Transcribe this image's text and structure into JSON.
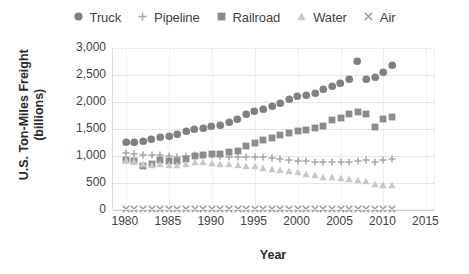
{
  "chart_data": {
    "type": "scatter",
    "title": "",
    "xlabel": "Year",
    "ylabel": "U.S. Ton-Miles Freight (billions)",
    "xlim": [
      1978.5,
      2016
    ],
    "ylim": [
      0,
      3000
    ],
    "grid": true,
    "legend_position": "top-center",
    "xticks": [
      "1980",
      "1985",
      "1990",
      "1995",
      "2000",
      "2005",
      "2010",
      "2015"
    ],
    "xtick_values": [
      1980,
      1985,
      1990,
      1995,
      2000,
      2005,
      2010,
      2015
    ],
    "yticks": [
      "0",
      "500",
      "1,000",
      "1,500",
      "2,000",
      "2,500",
      "3,000"
    ],
    "ytick_values": [
      0,
      500,
      1000,
      1500,
      2000,
      2500,
      3000
    ],
    "x": [
      1980,
      1981,
      1982,
      1983,
      1984,
      1985,
      1986,
      1987,
      1988,
      1989,
      1990,
      1991,
      1992,
      1993,
      1994,
      1995,
      1996,
      1997,
      1998,
      1999,
      2000,
      2001,
      2002,
      2003,
      2004,
      2005,
      2006,
      2007,
      2008,
      2009,
      2010,
      2011
    ],
    "series": [
      {
        "name": "Truck",
        "marker": "circle",
        "color": "#808080",
        "values": [
          1250,
          1260,
          1280,
          1310,
          1340,
          1370,
          1400,
          1450,
          1490,
          1520,
          1560,
          1570,
          1620,
          1680,
          1770,
          1820,
          1870,
          1920,
          1970,
          2050,
          2100,
          2120,
          2170,
          2230,
          2300,
          2350,
          2420,
          2750,
          2420,
          2450,
          2560,
          2680
        ]
      },
      {
        "name": "Pipeline",
        "marker": "plus",
        "color": "#a6a6a6",
        "values": [
          1050,
          1040,
          1020,
          1010,
          1010,
          1000,
          990,
          1000,
          1010,
          1020,
          1010,
          1000,
          990,
          980,
          980,
          990,
          980,
          960,
          950,
          930,
          910,
          900,
          890,
          880,
          880,
          880,
          890,
          900,
          920,
          880,
          920,
          940
        ]
      },
      {
        "name": "Railroad",
        "marker": "square",
        "color": "#8c8c8c",
        "values": [
          930,
          900,
          820,
          850,
          920,
          900,
          900,
          950,
          1000,
          1020,
          1030,
          1040,
          1070,
          1100,
          1180,
          1250,
          1290,
          1340,
          1380,
          1430,
          1470,
          1490,
          1510,
          1550,
          1660,
          1700,
          1770,
          1820,
          1780,
          1530,
          1690,
          1730
        ]
      },
      {
        "name": "Water",
        "marker": "triangle",
        "color": "#c8c8c8",
        "values": [
          920,
          900,
          850,
          830,
          860,
          830,
          840,
          860,
          880,
          890,
          870,
          860,
          850,
          830,
          820,
          810,
          780,
          760,
          740,
          720,
          700,
          660,
          640,
          620,
          610,
          590,
          570,
          560,
          530,
          480,
          470,
          460
        ]
      },
      {
        "name": "Air",
        "marker": "cross",
        "color": "#9a9a9a",
        "values": [
          10,
          10,
          11,
          11,
          12,
          12,
          13,
          13,
          14,
          14,
          14,
          14,
          15,
          15,
          16,
          16,
          17,
          17,
          17,
          18,
          18,
          17,
          17,
          18,
          19,
          19,
          19,
          19,
          18,
          16,
          17,
          17
        ]
      }
    ]
  },
  "legend": {
    "items": [
      {
        "label": "Truck",
        "marker": "circle",
        "color": "#808080"
      },
      {
        "label": "Pipeline",
        "marker": "plus",
        "color": "#a6a6a6"
      },
      {
        "label": "Railroad",
        "marker": "square",
        "color": "#8c8c8c"
      },
      {
        "label": "Water",
        "marker": "triangle",
        "color": "#c8c8c8"
      },
      {
        "label": "Air",
        "marker": "cross",
        "color": "#9a9a9a"
      }
    ]
  },
  "axes": {
    "y_title_line1": "U.S. Ton-Miles Freight",
    "y_title_line2": "(billions)",
    "x_title": "Year"
  }
}
